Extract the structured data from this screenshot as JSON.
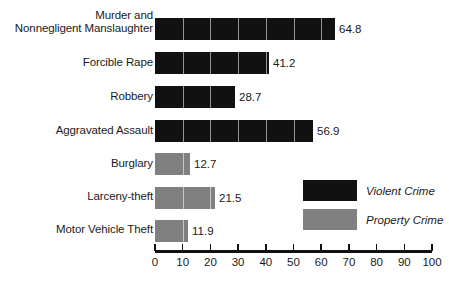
{
  "chart_data": {
    "type": "bar",
    "orientation": "horizontal",
    "title": "",
    "subtitle": "",
    "xlabel": "",
    "ylabel": "",
    "xlim": [
      0,
      100
    ],
    "xticks": [
      0,
      10,
      20,
      30,
      40,
      50,
      60,
      70,
      80,
      90,
      100
    ],
    "xtick_labels": [
      "0",
      "10",
      "20",
      "30",
      "40",
      "50",
      "60",
      "70",
      "80",
      "90",
      "100"
    ],
    "grid": false,
    "categories": [
      "Murder and\nNonnegligent Manslaughter",
      "Forcible Rape",
      "Robbery",
      "Aggravated Assault",
      "Burglary",
      "Larceny-theft",
      "Motor Vehicle Theft"
    ],
    "values": [
      64.8,
      41.2,
      28.7,
      56.9,
      12.7,
      21.5,
      11.9
    ],
    "value_labels": [
      "64.8",
      "41.2",
      "28.7",
      "56.9",
      "12.7",
      "21.5",
      "11.9"
    ],
    "groups": [
      "Violent Crime",
      "Violent Crime",
      "Violent Crime",
      "Violent Crime",
      "Property Crime",
      "Property Crime",
      "Property Crime"
    ],
    "series": [
      {
        "name": "Violent Crime",
        "color": "#111111",
        "points": [
          {
            "category": "Murder and\nNonnegligent Manslaughter",
            "value": 64.8
          },
          {
            "category": "Forcible Rape",
            "value": 41.2
          },
          {
            "category": "Robbery",
            "value": 28.7
          },
          {
            "category": "Aggravated Assault",
            "value": 56.9
          }
        ]
      },
      {
        "name": "Property Crime",
        "color": "#808080",
        "points": [
          {
            "category": "Burglary",
            "value": 12.7
          },
          {
            "category": "Larceny-theft",
            "value": 21.5
          },
          {
            "category": "Motor Vehicle Theft",
            "value": 11.9
          }
        ]
      }
    ],
    "legend": {
      "position": "inside-right",
      "entries": [
        {
          "label": "Violent Crime",
          "color": "#111111"
        },
        {
          "label": "Property Crime",
          "color": "#808080"
        }
      ]
    },
    "colors": {
      "violent": "#111111",
      "property": "#808080",
      "axis": "#111111",
      "text": "#1a1a1a",
      "background": "#ffffff"
    }
  }
}
